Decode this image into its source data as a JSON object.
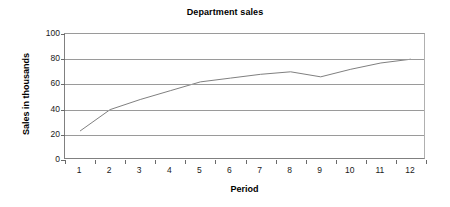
{
  "chart_data": {
    "type": "line",
    "title": "Department sales",
    "xlabel": "Period",
    "ylabel": "Sales in thousands",
    "x": [
      1,
      2,
      3,
      4,
      5,
      6,
      7,
      8,
      9,
      10,
      11,
      12
    ],
    "categories": [
      "1",
      "2",
      "3",
      "4",
      "5",
      "6",
      "7",
      "8",
      "9",
      "10",
      "11",
      "12"
    ],
    "series": [
      {
        "name": "Sales",
        "values": [
          23,
          40,
          48,
          55,
          62,
          65,
          68,
          70,
          66,
          72,
          77,
          80
        ],
        "color": "#808080"
      }
    ],
    "ylim": [
      0,
      100
    ],
    "yticks": [
      0,
      20,
      40,
      60,
      80,
      100
    ],
    "ytick_labels": [
      "0",
      "20",
      "40",
      "60",
      "80",
      "100"
    ],
    "grid": true,
    "grid_axis": "y",
    "legend": false,
    "legend_position": "none",
    "markers": false
  },
  "axes": {
    "y_title": "Sales in thousands",
    "x_title": "Period"
  }
}
